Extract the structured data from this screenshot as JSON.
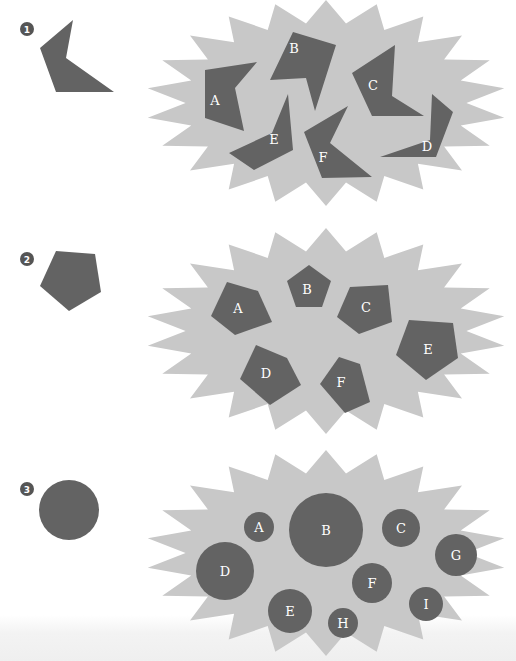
{
  "colors": {
    "background": "#ffffff",
    "burst": "#c8c8c8",
    "shape": "#636363",
    "label": "#ffffff",
    "badge": "#555555"
  },
  "panels": [
    {
      "number": "1",
      "badge": {
        "cx": 27,
        "cy": 29,
        "r": 7
      },
      "sample_shape": {
        "type": "chevron",
        "points": "73,20 40,48 56,92 114,92 66,58"
      },
      "burst": {
        "cx": 326,
        "cy": 103,
        "rx": 180,
        "ry": 103,
        "spikes": 22,
        "inner": 0.78
      },
      "pieces": [
        {
          "label": "A",
          "points": "205,70 257,62 235,88 244,131 205,118",
          "lx": 215,
          "ly": 100
        },
        {
          "label": "B",
          "points": "293,32 336,45 315,111 306,78 270,80",
          "lx": 294,
          "ly": 48
        },
        {
          "label": "C",
          "points": "395,45 392,96 424,116 372,116 352,73",
          "lx": 373,
          "ly": 85
        },
        {
          "label": "D",
          "points": "432,94 453,112 436,157 380,157 430,140",
          "lx": 427,
          "ly": 146
        },
        {
          "label": "E",
          "points": "288,94 293,150 254,170 229,153 272,133",
          "lx": 274,
          "ly": 139
        },
        {
          "label": "F",
          "points": "348,106 330,143 372,177 322,178 304,132",
          "lx": 323,
          "ly": 157
        }
      ]
    },
    {
      "number": "2",
      "badge": {
        "cx": 27,
        "cy": 259,
        "r": 7
      },
      "sample_shape": {
        "type": "pentagon",
        "points": "56,251 95,254 101,292 69,311 40,286"
      },
      "burst": {
        "cx": 326,
        "cy": 331,
        "rx": 180,
        "ry": 103,
        "spikes": 22,
        "inner": 0.78
      },
      "pieces": [
        {
          "label": "A",
          "points": "227,282 258,291 272,322 235,335 211,316",
          "lx": 238,
          "ly": 308
        },
        {
          "label": "B",
          "points": "309,265 331,281 322,307 296,307 287,281",
          "lx": 307,
          "ly": 289
        },
        {
          "label": "C",
          "points": "350,287 388,285 392,322 359,334 337,317",
          "lx": 366,
          "ly": 307
        },
        {
          "label": "D",
          "points": "256,345 287,358 301,385 270,405 240,379",
          "lx": 266,
          "ly": 373
        },
        {
          "label": "F",
          "points": "339,357 360,364 370,402 345,413 320,384",
          "lx": 341,
          "ly": 382
        },
        {
          "label": "E",
          "points": "409,320 453,323 458,358 426,380 396,355",
          "lx": 428,
          "ly": 349
        }
      ]
    },
    {
      "number": "3",
      "badge": {
        "cx": 27,
        "cy": 489,
        "r": 7
      },
      "sample_shape": {
        "type": "circle",
        "cx": 69,
        "cy": 510,
        "r": 30
      },
      "burst": {
        "cx": 326,
        "cy": 553,
        "rx": 180,
        "ry": 103,
        "spikes": 22,
        "inner": 0.78
      },
      "pieces": [
        {
          "label": "A",
          "cx": 259,
          "cy": 527,
          "r": 15
        },
        {
          "label": "B",
          "cx": 326,
          "cy": 530,
          "r": 37
        },
        {
          "label": "C",
          "cx": 401,
          "cy": 528,
          "r": 19
        },
        {
          "label": "D",
          "cx": 225,
          "cy": 571,
          "r": 29
        },
        {
          "label": "E",
          "cx": 290,
          "cy": 611,
          "r": 22
        },
        {
          "label": "F",
          "cx": 372,
          "cy": 583,
          "r": 20
        },
        {
          "label": "G",
          "cx": 456,
          "cy": 555,
          "r": 21
        },
        {
          "label": "H",
          "cx": 343,
          "cy": 623,
          "r": 15
        },
        {
          "label": "I",
          "cx": 426,
          "cy": 604,
          "r": 17
        }
      ]
    }
  ]
}
